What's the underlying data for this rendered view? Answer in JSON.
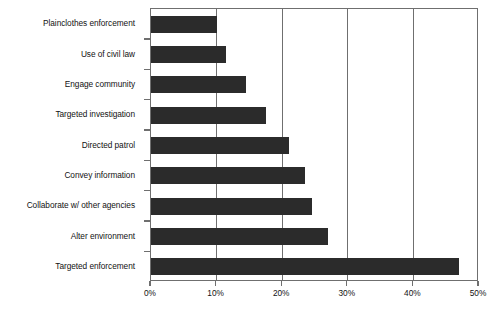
{
  "chart_data": {
    "type": "bar",
    "orientation": "horizontal",
    "title": "",
    "subtitle": "",
    "xlabel": "",
    "ylabel": "",
    "xlim": [
      0,
      50
    ],
    "ylim": null,
    "grid": true,
    "legend": null,
    "legend_position": "none",
    "categories": [
      "Plainclothes enforcement",
      "Use of civil law",
      "Engage community",
      "Targeted investigation",
      "Directed patrol",
      "Convey information",
      "Collaborate w/ other agencies",
      "Alter environment",
      "Targeted enforcement"
    ],
    "values": [
      10,
      11.5,
      14.5,
      17.5,
      21,
      23.5,
      24.5,
      27,
      47
    ],
    "value_unit": "%",
    "xticks": [
      0,
      10,
      20,
      30,
      40,
      50
    ],
    "xtick_labels": [
      "0%",
      "10%",
      "20%",
      "30%",
      "40%",
      "50%"
    ],
    "bar_color": "#2b2b2b",
    "axis_color": "#6f6f6f",
    "background_color": "#ffffff",
    "text_color": "#121212"
  }
}
